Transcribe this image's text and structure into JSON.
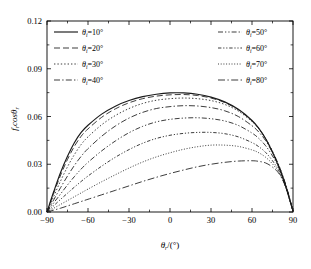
{
  "chart_data": {
    "type": "line",
    "title": "",
    "xlabel": "θr/(°)",
    "ylabel": "fr cosθr",
    "xlim": [
      -90,
      90
    ],
    "ylim": [
      0.0,
      0.12
    ],
    "xticks": [
      -90,
      -60,
      -30,
      0,
      30,
      60,
      90
    ],
    "xticklabels": [
      "-90",
      "-60",
      "-30",
      "0",
      "30",
      "60",
      "90"
    ],
    "yticks": [
      0.0,
      0.03,
      0.06,
      0.09,
      0.12
    ],
    "yticklabels": [
      "0.00",
      "0.03",
      "0.06",
      "0.09",
      "0.12"
    ],
    "grid": false,
    "legend_position": "top-inside-two-columns",
    "x": [
      -90,
      -85,
      -80,
      -75,
      -70,
      -65,
      -60,
      -50,
      -40,
      -30,
      -20,
      -10,
      0,
      10,
      20,
      30,
      40,
      50,
      60,
      65,
      70,
      75,
      80,
      85,
      90
    ],
    "series": [
      {
        "name": "θi=10°",
        "style": "solid",
        "values": [
          0.0,
          0.013,
          0.025,
          0.035,
          0.0435,
          0.05,
          0.0545,
          0.0615,
          0.0665,
          0.07,
          0.0725,
          0.074,
          0.0748,
          0.0748,
          0.074,
          0.0722,
          0.0692,
          0.0645,
          0.0575,
          0.0525,
          0.046,
          0.0375,
          0.0275,
          0.015,
          0.0005
        ]
      },
      {
        "name": "θi=20°",
        "style": "dashed",
        "values": [
          0.0,
          0.012,
          0.0232,
          0.033,
          0.0412,
          0.0476,
          0.0522,
          0.0595,
          0.0648,
          0.0686,
          0.0712,
          0.0728,
          0.0736,
          0.0738,
          0.0732,
          0.0716,
          0.0688,
          0.0642,
          0.0572,
          0.0524,
          0.046,
          0.0378,
          0.028,
          0.0156,
          0.0005
        ]
      },
      {
        "name": "θi=30°",
        "style": "dotted",
        "values": [
          0.0,
          0.01,
          0.0196,
          0.0284,
          0.036,
          0.0424,
          0.0472,
          0.0548,
          0.0606,
          0.065,
          0.0682,
          0.0702,
          0.0712,
          0.0716,
          0.0712,
          0.07,
          0.0676,
          0.0634,
          0.0568,
          0.0522,
          0.0462,
          0.0382,
          0.0286,
          0.0162,
          0.0005
        ]
      },
      {
        "name": "θi=40°",
        "style": "dashdot",
        "values": [
          0.0,
          0.0078,
          0.0154,
          0.0226,
          0.0292,
          0.035,
          0.0398,
          0.0476,
          0.054,
          0.059,
          0.0626,
          0.065,
          0.0662,
          0.0668,
          0.0666,
          0.0656,
          0.0636,
          0.06,
          0.0542,
          0.0502,
          0.0448,
          0.0374,
          0.0284,
          0.0164,
          0.0005
        ]
      },
      {
        "name": "θi=50°",
        "style": "dashdotdot",
        "values": [
          0.0,
          0.0058,
          0.0114,
          0.017,
          0.0222,
          0.027,
          0.0312,
          0.0384,
          0.0446,
          0.0498,
          0.0538,
          0.0566,
          0.0582,
          0.059,
          0.0592,
          0.0586,
          0.0572,
          0.0544,
          0.0496,
          0.0462,
          0.0416,
          0.0352,
          0.0272,
          0.016,
          0.0005
        ]
      },
      {
        "name": "θi=60°",
        "style": "dashdotdot-fine",
        "values": [
          0.0,
          0.004,
          0.008,
          0.0118,
          0.0156,
          0.0192,
          0.0226,
          0.0288,
          0.0344,
          0.0392,
          0.0432,
          0.0462,
          0.0482,
          0.0494,
          0.05,
          0.05,
          0.0492,
          0.0472,
          0.0436,
          0.041,
          0.0374,
          0.0322,
          0.0254,
          0.0152,
          0.0005
        ]
      },
      {
        "name": "θi=70°",
        "style": "dotted-fine",
        "values": [
          0.0,
          0.0024,
          0.0048,
          0.0072,
          0.0096,
          0.012,
          0.0144,
          0.019,
          0.0234,
          0.0276,
          0.0314,
          0.0346,
          0.0372,
          0.0394,
          0.041,
          0.042,
          0.042,
          0.0412,
          0.039,
          0.0372,
          0.0344,
          0.0302,
          0.0244,
          0.0148,
          0.0005
        ]
      },
      {
        "name": "θi=80°",
        "style": "longdashdot",
        "values": [
          0.0,
          0.0012,
          0.0024,
          0.0038,
          0.0052,
          0.0066,
          0.008,
          0.0108,
          0.0136,
          0.0164,
          0.0192,
          0.0218,
          0.0242,
          0.0264,
          0.0284,
          0.03,
          0.0312,
          0.032,
          0.0322,
          0.0318,
          0.0308,
          0.0282,
          0.0238,
          0.015,
          0.0005
        ]
      }
    ]
  },
  "legend": {
    "left_column": [
      {
        "label_base": "θ",
        "sub": "i",
        "label_rest": "=10°",
        "style": "solid"
      },
      {
        "label_base": "θ",
        "sub": "i",
        "label_rest": "=20°",
        "style": "dashed"
      },
      {
        "label_base": "θ",
        "sub": "i",
        "label_rest": "=30°",
        "style": "dotted"
      },
      {
        "label_base": "θ",
        "sub": "i",
        "label_rest": "=40°",
        "style": "dashdot"
      }
    ],
    "right_column": [
      {
        "label_base": "θ",
        "sub": "i",
        "label_rest": "=50°",
        "style": "dashdotdot"
      },
      {
        "label_base": "θ",
        "sub": "i",
        "label_rest": "=60°",
        "style": "dashdotdot-fine"
      },
      {
        "label_base": "θ",
        "sub": "i",
        "label_rest": "=70°",
        "style": "dotted-fine"
      },
      {
        "label_base": "θ",
        "sub": "i",
        "label_rest": "=80°",
        "style": "longdashdot"
      }
    ]
  },
  "axes": {
    "ylabel_main": "f",
    "ylabel_sub1": "r",
    "ylabel_mid": "cosθ",
    "ylabel_sub2": "r",
    "xlabel_main": "θ",
    "xlabel_sub": "r",
    "xlabel_rest": "/(°)"
  },
  "colors": {
    "axis": "#000000",
    "curve": "#1a1a1a",
    "background": "#ffffff"
  }
}
